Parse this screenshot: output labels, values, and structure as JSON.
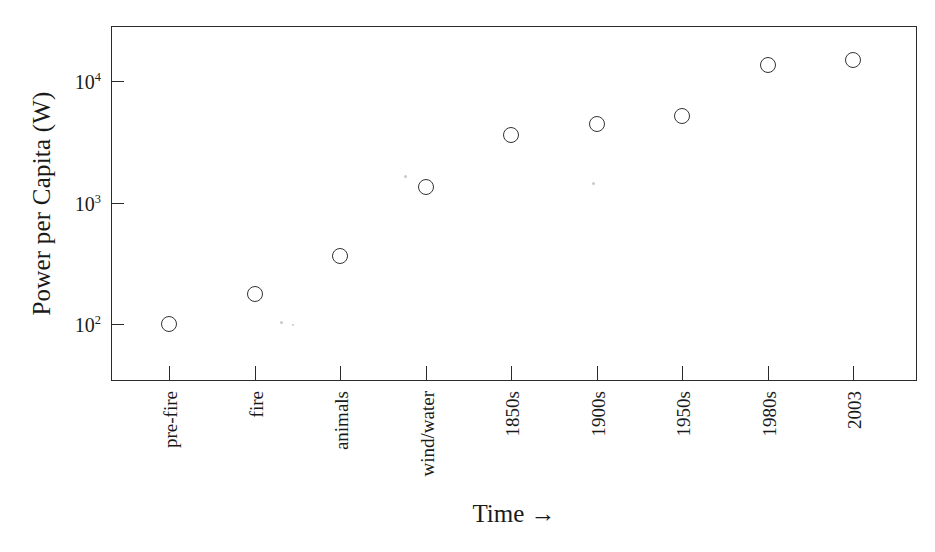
{
  "chart_data": {
    "type": "scatter",
    "title": "",
    "subtitle": "",
    "xlabel": "Time →",
    "ylabel": "Power per Capita (W)",
    "yscale": "log",
    "ylim": [
      40,
      40000
    ],
    "grid": false,
    "legend": null,
    "categories": [
      "pre-fire",
      "fire",
      "animals",
      "wind/water",
      "1850s",
      "1900s",
      "1950s",
      "1980s",
      "2003"
    ],
    "values": [
      100,
      175,
      360,
      1350,
      3600,
      4400,
      5200,
      13500,
      15000
    ],
    "y_tick_labels": [
      "10",
      "10",
      "10"
    ],
    "y_tick_exponents": [
      "2",
      "3",
      "4"
    ],
    "y_tick_values": [
      100,
      1000,
      10000
    ],
    "points": [
      {
        "label": "pre-fire",
        "value": 100
      },
      {
        "label": "fire",
        "value": 175
      },
      {
        "label": "animals",
        "value": 360
      },
      {
        "label": "wind/water",
        "value": 1350
      },
      {
        "label": "1850s",
        "value": 3600
      },
      {
        "label": "1900s",
        "value": 4400
      },
      {
        "label": "1950s",
        "value": 5200
      },
      {
        "label": "1980s",
        "value": 13500
      },
      {
        "label": "2003",
        "value": 15000
      }
    ],
    "marker": "open-circle",
    "marker_color": "#333333",
    "axis_color": "#2b2b2b",
    "background_color": "#ffffff"
  },
  "axes": {
    "y_title": "Power per Capita (W)",
    "x_title": "Time →"
  },
  "y_ticks": [
    {
      "mantissa": "10",
      "exponent": "2",
      "value": 100
    },
    {
      "mantissa": "10",
      "exponent": "3",
      "value": 1000
    },
    {
      "mantissa": "10",
      "exponent": "4",
      "value": 10000
    }
  ],
  "x_ticks": [
    {
      "label": "pre-fire"
    },
    {
      "label": "fire"
    },
    {
      "label": "animals"
    },
    {
      "label": "wind/water"
    },
    {
      "label": "1850s"
    },
    {
      "label": "1900s"
    },
    {
      "label": "1950s"
    },
    {
      "label": "1980s"
    },
    {
      "label": "2003"
    }
  ]
}
